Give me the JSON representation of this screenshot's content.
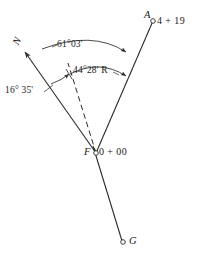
{
  "figure": {
    "background_color": "#ffffff",
    "line_color": "#2b2b2b",
    "text_color": "#1a1a1a",
    "width": 208,
    "height": 260
  },
  "points": {
    "north": {
      "label": "N",
      "name": "north-arrow"
    },
    "a": {
      "label": "A",
      "station": "4 + 19"
    },
    "f": {
      "label": "F",
      "station": "0 + 00"
    },
    "g": {
      "label": "G",
      "station": ""
    }
  },
  "angles": {
    "total_deflection": "61°03'",
    "deflection_right": "44°28' R",
    "back_azimuth": "16° 35'"
  },
  "lines": [
    {
      "name": "line-f-to-north",
      "style": "solid",
      "from": "F",
      "to": "N"
    },
    {
      "name": "line-f-to-a",
      "style": "solid",
      "from": "F",
      "to": "A"
    },
    {
      "name": "line-f-to-g",
      "style": "solid",
      "from": "F",
      "to": "G"
    },
    {
      "name": "line-f-tangent-dashed",
      "style": "dashed",
      "from": "F",
      "to": "tangent"
    }
  ],
  "arcs": [
    {
      "name": "arc-61-03",
      "label": "61°03'"
    },
    {
      "name": "arc-44-28",
      "label": "44°28' R"
    },
    {
      "name": "arc-16-35",
      "label": "16° 35'"
    }
  ]
}
